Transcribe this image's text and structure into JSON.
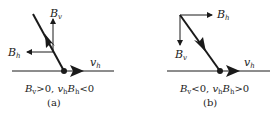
{
  "panels": [
    {
      "id": "a",
      "labels": {
        "bv_main": "B",
        "bv_sub": "v",
        "bh_main": "B",
        "bh_sub": "h",
        "vh_main": "v",
        "vh_sub": "h"
      },
      "condition": {
        "p1": "B",
        "p1sub": "v",
        "p1rel": ">0, ",
        "p2": "v",
        "p2sub": "h",
        "p3": "B",
        "p3sub": "h",
        "p3rel": "<0"
      },
      "caption": "(a)"
    },
    {
      "id": "b",
      "labels": {
        "bv_main": "B",
        "bv_sub": "v",
        "bh_main": "B",
        "bh_sub": "h",
        "vh_main": "v",
        "vh_sub": "h"
      },
      "condition": {
        "p1": "B",
        "p1sub": "v",
        "p1rel": "<0, ",
        "p2": "v",
        "p2sub": "h",
        "p3": "B",
        "p3sub": "h",
        "p3rel": ">0"
      },
      "caption": "(b)"
    }
  ],
  "colors": {
    "ink": "#1a1a1a",
    "background": "#ffffff"
  }
}
